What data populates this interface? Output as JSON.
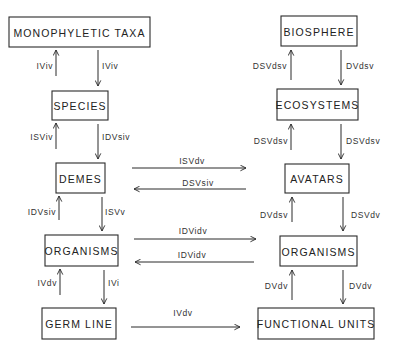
{
  "diagram": {
    "type": "hierarchy-correspondence",
    "left_column_title": "genealogical hierarchy",
    "nodes": [
      {
        "id": "monophyletic_taxa",
        "label": "MONOPHYLETIC TAXA"
      },
      {
        "id": "species",
        "label": "SPECIES"
      },
      {
        "id": "demes",
        "label": "DEMES"
      },
      {
        "id": "organisms_left",
        "label": "ORGANISMS"
      },
      {
        "id": "germ_line",
        "label": "GERM LINE"
      },
      {
        "id": "biosphere",
        "label": "BIOSPHERE"
      },
      {
        "id": "ecosystems",
        "label": "ECOSYSTEMS"
      },
      {
        "id": "avatars",
        "label": "AVATARS"
      },
      {
        "id": "organisms_right",
        "label": "ORGANISMS"
      },
      {
        "id": "functional_units",
        "label": "FUNCTIONAL UNITS"
      }
    ],
    "edges": [
      {
        "from": "species",
        "to": "monophyletic_taxa",
        "label": "IViv"
      },
      {
        "from": "monophyletic_taxa",
        "to": "species",
        "label": "IViv"
      },
      {
        "from": "demes",
        "to": "species",
        "label": "ISViv"
      },
      {
        "from": "species",
        "to": "demes",
        "label": "IDVsiv"
      },
      {
        "from": "organisms_left",
        "to": "demes",
        "label": "IDVsiv"
      },
      {
        "from": "demes",
        "to": "organisms_left",
        "label": "ISVv"
      },
      {
        "from": "germ_line",
        "to": "organisms_left",
        "label": "IVdv"
      },
      {
        "from": "organisms_left",
        "to": "germ_line",
        "label": "IVi"
      },
      {
        "from": "ecosystems",
        "to": "biosphere",
        "label": "DSVdsv"
      },
      {
        "from": "biosphere",
        "to": "ecosystems",
        "label": "DVdsv"
      },
      {
        "from": "avatars",
        "to": "ecosystems",
        "label": "DSVdsv"
      },
      {
        "from": "ecosystems",
        "to": "avatars",
        "label": "DSVdsv"
      },
      {
        "from": "organisms_right",
        "to": "avatars",
        "label": "DVdsv"
      },
      {
        "from": "avatars",
        "to": "organisms_right",
        "label": "DSVdv"
      },
      {
        "from": "functional_units",
        "to": "organisms_right",
        "label": "DVdv"
      },
      {
        "from": "organisms_right",
        "to": "functional_units",
        "label": "DVdv"
      },
      {
        "from": "demes",
        "to": "avatars",
        "label": "ISVdv"
      },
      {
        "from": "avatars",
        "to": "demes",
        "label": "DSVsiv"
      },
      {
        "from": "organisms_left",
        "to": "organisms_right",
        "label": "IDVidv"
      },
      {
        "from": "organisms_right",
        "to": "organisms_left",
        "label": "IDVidv"
      },
      {
        "from": "germ_line",
        "to": "functional_units",
        "label": "IVdv"
      }
    ]
  }
}
